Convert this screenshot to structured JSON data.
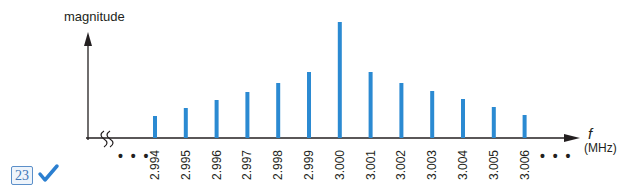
{
  "chart_data": {
    "type": "bar",
    "title": "",
    "ylabel": "magnitude",
    "xlabel": "f",
    "xlabel_unit": "(MHz)",
    "categories": [
      "2.994",
      "2.995",
      "2.996",
      "2.997",
      "2.998",
      "2.999",
      "3.000",
      "3.001",
      "3.002",
      "3.003",
      "3.004",
      "3.005",
      "3.006"
    ],
    "values": [
      22,
      30,
      38,
      46,
      55,
      66,
      116,
      66,
      55,
      47,
      39,
      31,
      23
    ],
    "value_units": "relative (px height, no y-axis ticks shown)",
    "bar_color": "#2b8ad2",
    "axis_break": "x-axis break marks near origin",
    "ellipsis_left": "• • •",
    "ellipsis_right": "• • •",
    "grid": false,
    "legend": null
  },
  "figure": {
    "badge_number": "23",
    "check_color": "#2b7fd0",
    "badge_color": "#3f77b8"
  }
}
